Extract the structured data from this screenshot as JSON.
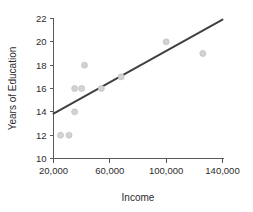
{
  "chart_data": {
    "type": "scatter",
    "title": "",
    "xlabel": "Income",
    "ylabel": "Years of Education",
    "xlim": [
      20000,
      140000
    ],
    "ylim": [
      10,
      22
    ],
    "grid": false,
    "legend": null,
    "x_ticks": [
      {
        "value": 20000,
        "label": "20,000"
      },
      {
        "value": 60000,
        "label": "60,000"
      },
      {
        "value": 100000,
        "label": "100,000"
      },
      {
        "value": 140000,
        "label": "140,000"
      }
    ],
    "y_ticks": [
      {
        "value": 10,
        "label": "10"
      },
      {
        "value": 12,
        "label": "12"
      },
      {
        "value": 14,
        "label": "14"
      },
      {
        "value": 16,
        "label": "16"
      },
      {
        "value": 18,
        "label": "18"
      },
      {
        "value": 20,
        "label": "20"
      },
      {
        "value": 22,
        "label": "22"
      }
    ],
    "points": [
      {
        "x": 25000,
        "y": 12
      },
      {
        "x": 31000,
        "y": 12
      },
      {
        "x": 35000,
        "y": 14
      },
      {
        "x": 35000,
        "y": 16
      },
      {
        "x": 40000,
        "y": 16
      },
      {
        "x": 42000,
        "y": 18
      },
      {
        "x": 54000,
        "y": 16
      },
      {
        "x": 68000,
        "y": 17
      },
      {
        "x": 100000,
        "y": 20
      },
      {
        "x": 126000,
        "y": 19
      }
    ],
    "point_color": "#d3d3d3",
    "point_edge_color": "#bfbfbf",
    "point_radius_px": 3,
    "trend_line": {
      "color": "#404040",
      "x_start": 20000,
      "y_start": 13.85,
      "x_end": 140000,
      "y_end": 21.9
    },
    "axis_color": "#5a5a5a",
    "text_color": "#2b2b2b",
    "background_color": "#ffffff"
  }
}
